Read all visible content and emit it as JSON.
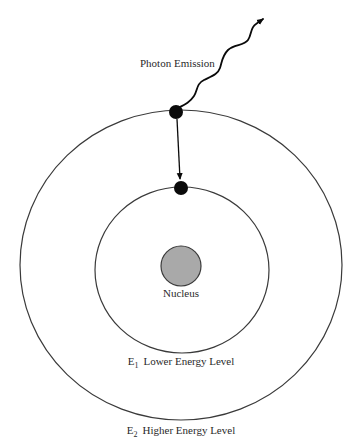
{
  "diagram": {
    "type": "bohr-atom-photon-emission",
    "labels": {
      "photon": "Photon Emission",
      "nucleus": "Nucleus",
      "inner_level_symbol": "E",
      "inner_level_subscript": "1",
      "inner_level_text": "Lower Energy Level",
      "outer_level_symbol": "E",
      "outer_level_subscript": "2",
      "outer_level_text": "Higher Energy Level"
    },
    "colors": {
      "background": "#ffffff",
      "orbit_stroke": "#3a3a3a",
      "electron_fill": "#0a0a0a",
      "nucleus_fill": "#a9a9a9",
      "nucleus_stroke": "#3a3a3a",
      "text": "#2a2a2a"
    },
    "elements": {
      "outer_orbit": {
        "cx": 181,
        "cy": 265,
        "rx": 161,
        "ry": 155
      },
      "inner_orbit": {
        "cx": 182,
        "cy": 270,
        "rx": 87,
        "ry": 83
      },
      "nucleus": {
        "cx": 181,
        "cy": 266,
        "r": 20
      },
      "electron_outer": {
        "cx": 176,
        "cy": 112,
        "r": 7
      },
      "electron_inner": {
        "cx": 181,
        "cy": 188,
        "r": 7
      },
      "transition_arrow": {
        "from": [
          177,
          119
        ],
        "to": [
          180,
          180
        ]
      },
      "photon_arrow_tip": [
        265,
        18
      ]
    }
  }
}
